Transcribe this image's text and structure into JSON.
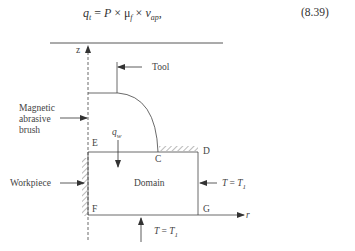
{
  "equation": {
    "lhs": "q",
    "lhs_sub": "t",
    "rhs_p": "P",
    "times1": "×",
    "mu": "μ",
    "mu_sub": "f",
    "times2": "×",
    "v": "v",
    "v_sub": "ap",
    "trailing": ",",
    "equals": "=",
    "number": "(8.39)"
  },
  "diagram": {
    "axis_z_label": "z",
    "axis_r_label": "r",
    "tool_label": "Tool",
    "brush_label_lines": [
      "Magnetic",
      "abrasive",
      "brush"
    ],
    "workpiece_label": "Workpiece",
    "domain_label": "Domain",
    "flux_label": "q",
    "flux_sub": "w",
    "points": {
      "E": "E",
      "C": "C",
      "D": "D",
      "F": "F",
      "G": "G"
    },
    "bc_right": {
      "lhs": "T",
      "eq": "=",
      "rhs": "T",
      "rhs_sub": "1"
    },
    "bc_bottom": {
      "lhs": "T",
      "eq": "=",
      "rhs": "T",
      "rhs_sub": "1"
    },
    "colors": {
      "line": "#444444",
      "text": "#333333"
    }
  }
}
